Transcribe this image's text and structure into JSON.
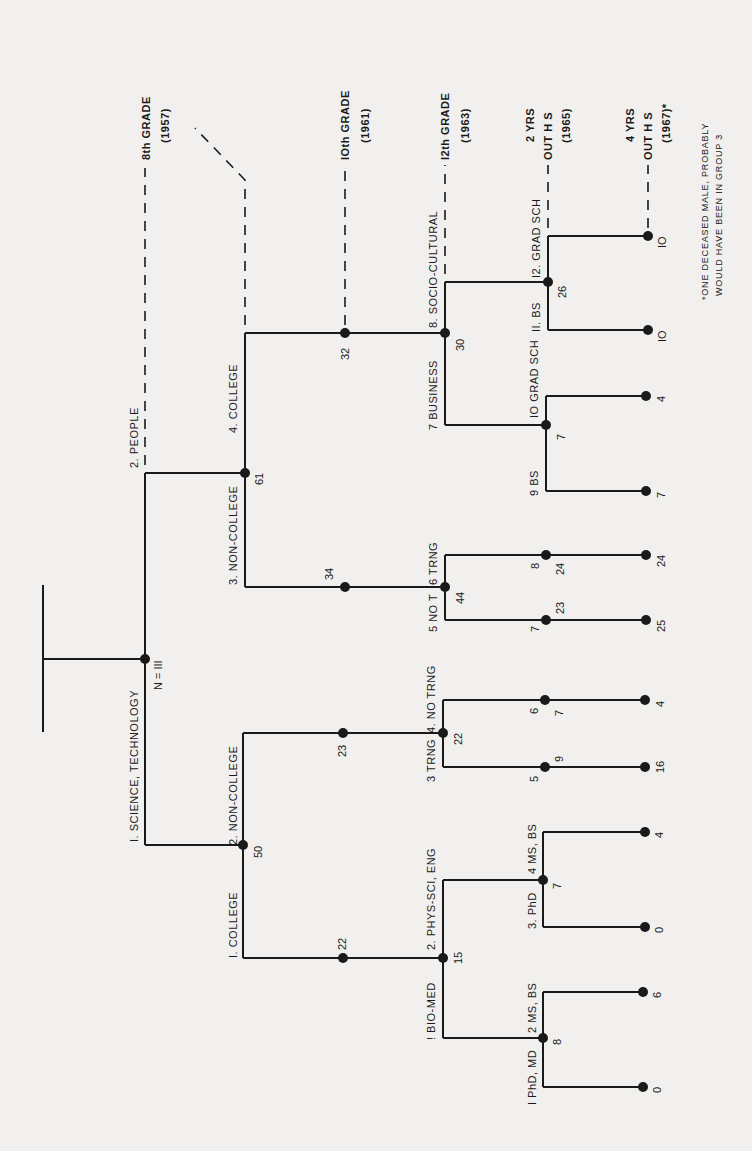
{
  "colors": {
    "background": "#f1f0ee",
    "ink": "#1a1a1a"
  },
  "root": {
    "label": "N = III"
  },
  "level1": {
    "sci_tech": {
      "label": "I. SCIENCE, TECHNOLOGY",
      "count": "50"
    },
    "people": {
      "label": "2. PEOPLE",
      "count": "61"
    }
  },
  "sci_tech": {
    "college": {
      "label": "I. COLLEGE",
      "count": "22"
    },
    "non_college": {
      "label": "2. NON-COLLEGE",
      "count": "23"
    },
    "college_split": {
      "count": "15",
      "bio_med": "! BIO-MED",
      "phys_sci": "2. PHYS-SCI, ENG"
    },
    "bio_med": {
      "count": "8",
      "phd_md": "I PhD, MD",
      "ms_bs": "2 MS, BS",
      "leaf_phd": "0",
      "leaf_ms": "6"
    },
    "phys_sci": {
      "count": "7",
      "phd": "3. PhD",
      "ms_bs": "4 MS, BS",
      "leaf_phd": "0",
      "leaf_ms": "4"
    },
    "non_college_split": {
      "count": "22",
      "trng": "3 TRNG",
      "no_trng": "4. NO TRNG"
    },
    "trng": {
      "group": "5",
      "count": "9",
      "leaf": "16"
    },
    "no_trng": {
      "group": "6",
      "count": "7",
      "leaf": "4"
    }
  },
  "people": {
    "non_college": {
      "label": "3. NON-COLLEGE",
      "count": "34"
    },
    "college": {
      "label": "4. COLLEGE",
      "count": "32"
    },
    "non_college_split": {
      "count": "44",
      "no_trng": "5 NO T",
      "trng": "6 TRNG"
    },
    "no_trng": {
      "group": "7",
      "count": "23",
      "leaf": "25"
    },
    "trng": {
      "group": "8",
      "count": "24",
      "leaf": "24"
    },
    "college_split": {
      "count": "30",
      "business": "7 BUSINESS",
      "socio": "8. SOCIO-CULTURAL"
    },
    "business": {
      "count": "7",
      "bs": "9 BS",
      "grad": "IO GRAD SCH",
      "leaf_bs": "7",
      "leaf_grad": "4"
    },
    "socio": {
      "count": "26",
      "bs": "II. BS",
      "grad": "I2. GRAD SCH",
      "leaf_bs": "IO",
      "leaf_grad": "IO"
    }
  },
  "timeline": [
    {
      "label": "8th GRADE",
      "year": "(1957)"
    },
    {
      "label": "IOth GRADE",
      "year": "(1961)"
    },
    {
      "label": "I2th GRADE",
      "year": "(1963)"
    },
    {
      "label": "2 YRS",
      "label2": "OUT H S",
      "year": "(1965)"
    },
    {
      "label": "4 YRS",
      "label2": "OUT H S",
      "year": "(1967)*"
    }
  ],
  "footnote": {
    "line1": "*ONE DECEASED MALE, PROBABLY",
    "line2": "WOULD HAVE BEEN IN GROUP 3"
  }
}
